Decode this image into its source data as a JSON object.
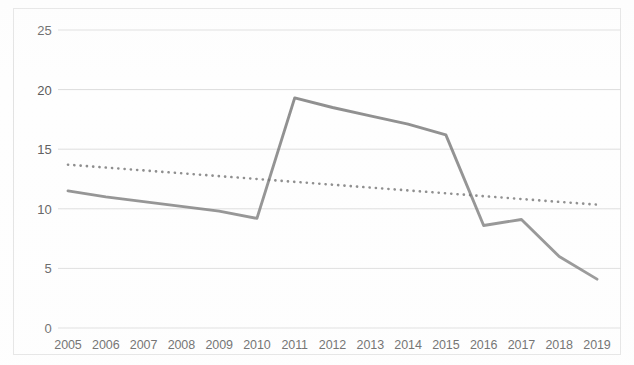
{
  "chart_data": {
    "type": "line",
    "title": "",
    "subtitle": "",
    "xlabel": "",
    "ylabel": "",
    "categories": [
      "2005",
      "2006",
      "2007",
      "2008",
      "2009",
      "2010",
      "2011",
      "2012",
      "2013",
      "2014",
      "2015",
      "2016",
      "2017",
      "2018",
      "2019"
    ],
    "ylim": [
      0,
      25
    ],
    "y_ticks": [
      0,
      5,
      10,
      15,
      20,
      25
    ],
    "y_tick_labels": [
      "0",
      "5",
      "10",
      "15",
      "20",
      "25"
    ],
    "grid": true,
    "legend": "none",
    "series": [
      {
        "name": "data",
        "style": "solid",
        "color": "#6e6e6e",
        "values": [
          11.5,
          11.0,
          10.6,
          10.2,
          9.8,
          9.2,
          19.3,
          18.5,
          17.8,
          17.1,
          16.2,
          8.6,
          9.1,
          6.0,
          4.1
        ]
      },
      {
        "name": "trendline",
        "style": "dotted",
        "color": "#6e6e6e",
        "values": [
          13.7,
          13.46,
          13.22,
          12.98,
          12.74,
          12.5,
          12.26,
          12.02,
          11.78,
          11.54,
          11.3,
          11.06,
          10.82,
          10.58,
          10.35
        ]
      }
    ],
    "annotations": []
  },
  "axes": {
    "y_labels": [
      "25",
      "20",
      "15",
      "10",
      "5",
      "0"
    ],
    "x_labels": [
      "2005",
      "2006",
      "2007",
      "2008",
      "2009",
      "2010",
      "2011",
      "2012",
      "2013",
      "2014",
      "2015",
      "2016",
      "2017",
      "2018",
      "2019"
    ]
  },
  "colors": {
    "line": "#6e6e6e",
    "trendline": "#6e6e6e",
    "grid": "#dcdcdc",
    "border": "#e2e2e2",
    "text": "#5a5a5a",
    "background": "#fefefe"
  }
}
